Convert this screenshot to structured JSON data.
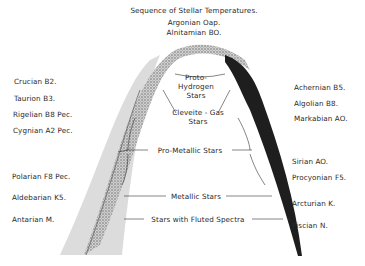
{
  "title": "Sequence of Stellar Temperatures.",
  "top_labels": [
    "Argonian Oap.",
    "Alnitamian BO."
  ],
  "left_labels": [
    {
      "text": "Crucian B2.",
      "x": 14,
      "y": 77
    },
    {
      "text": "Taurion B3.",
      "x": 14,
      "y": 94
    },
    {
      "text": "Rigelian B8 Pec.",
      "x": 13,
      "y": 110
    },
    {
      "text": "Cygnian A2 Pec.",
      "x": 13,
      "y": 126
    },
    {
      "text": "Polarian F8 Pec.",
      "x": 12,
      "y": 172
    },
    {
      "text": "Aldebarian K5.",
      "x": 12,
      "y": 193
    },
    {
      "text": "Antarian M.",
      "x": 12,
      "y": 215
    }
  ],
  "right_labels": [
    {
      "text": "Achernian B5.",
      "x": 294,
      "y": 83
    },
    {
      "text": "Algolian B8.",
      "x": 294,
      "y": 99
    },
    {
      "text": "Markabian AO.",
      "x": 294,
      "y": 114
    },
    {
      "text": "Sirian AO.",
      "x": 292,
      "y": 157
    },
    {
      "text": "Procyonian F5.",
      "x": 292,
      "y": 173
    },
    {
      "text": "Arcturian K.",
      "x": 292,
      "y": 199
    },
    {
      "text": "Piscian N.",
      "x": 292,
      "y": 221
    }
  ],
  "inner_labels": {
    "proto_hydrogen": [
      "Proto-",
      "Hydrogen",
      "Stars"
    ],
    "cleveite_gas": [
      "Cleveite - Gas",
      "Stars"
    ],
    "pro_metallic": "Pro-Metallic Stars",
    "metallic": "Metallic Stars",
    "fluted": "Stars with Fluted Spectra"
  },
  "colors": {
    "ink": "#2a2a2a",
    "left_band": "#d9d9d9",
    "left_stipple": "#6e6e6e",
    "right_band": "#1e1e1e"
  }
}
